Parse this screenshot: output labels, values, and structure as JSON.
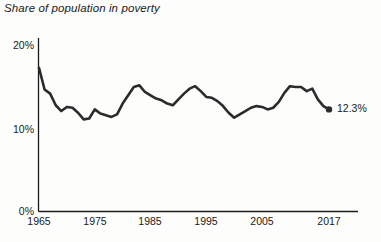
{
  "chart_data": {
    "type": "line",
    "title": "Share of population in poverty",
    "xlabel": "",
    "ylabel": "",
    "xlim": [
      1965,
      2017
    ],
    "ylim": [
      0,
      20
    ],
    "grid": false,
    "legend": false,
    "y_ticks": [
      "0%",
      "10%",
      "20%"
    ],
    "y_tick_values": [
      0,
      10,
      20
    ],
    "x_ticks": [
      "1965",
      "1975",
      "1985",
      "1995",
      "2005",
      "2017"
    ],
    "x_tick_values": [
      1965,
      1975,
      1985,
      1995,
      2005,
      2017
    ],
    "end_point_label": "12.3%",
    "line_color": "#2b2b2b",
    "x": [
      1965,
      1966,
      1967,
      1968,
      1969,
      1970,
      1971,
      1972,
      1973,
      1974,
      1975,
      1976,
      1977,
      1978,
      1979,
      1980,
      1981,
      1982,
      1983,
      1984,
      1985,
      1986,
      1987,
      1988,
      1989,
      1990,
      1991,
      1992,
      1993,
      1994,
      1995,
      1996,
      1997,
      1998,
      1999,
      2000,
      2001,
      2002,
      2003,
      2004,
      2005,
      2006,
      2007,
      2008,
      2009,
      2010,
      2011,
      2012,
      2013,
      2014,
      2015,
      2016,
      2017
    ],
    "values": [
      17.3,
      14.7,
      14.2,
      12.8,
      12.1,
      12.6,
      12.5,
      11.9,
      11.1,
      11.2,
      12.3,
      11.8,
      11.6,
      11.4,
      11.7,
      13.0,
      14.0,
      15.0,
      15.2,
      14.4,
      14.0,
      13.6,
      13.4,
      13.0,
      12.8,
      13.5,
      14.2,
      14.8,
      15.1,
      14.5,
      13.8,
      13.7,
      13.3,
      12.7,
      11.9,
      11.3,
      11.7,
      12.1,
      12.5,
      12.7,
      12.6,
      12.3,
      12.5,
      13.2,
      14.3,
      15.1,
      15.0,
      15.0,
      14.5,
      14.8,
      13.5,
      12.7,
      12.3
    ]
  }
}
